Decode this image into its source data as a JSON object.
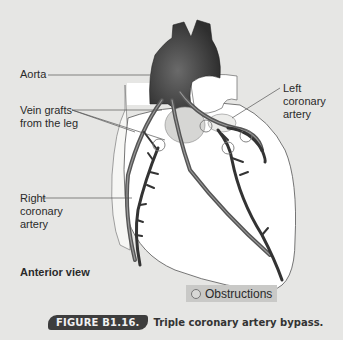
{
  "figure": {
    "labels": {
      "aorta": "Aorta",
      "vein_grafts_line1": "Vein grafts",
      "vein_grafts_line2": "from the leg",
      "left_coronary_line1": "Left",
      "left_coronary_line2": "coronary",
      "left_coronary_line3": "artery",
      "right_coronary_line1": "Right",
      "right_coronary_line2": "coronary",
      "right_coronary_line3": "artery"
    },
    "view_label": "Anterior view",
    "legend": {
      "icon": "circle-outline-icon",
      "label": "Obstructions"
    },
    "caption": {
      "number": "FIGURE B1.16.",
      "title": "Triple coronary artery bypass."
    },
    "colors": {
      "background": "#e6e6e4",
      "heart_fill": "#ffffff",
      "vessel": "#4a4a4a",
      "aorta": "#3a3a3a",
      "caption_badge": "#3d3d3d",
      "legend_bg": "#c9c9c7"
    }
  }
}
